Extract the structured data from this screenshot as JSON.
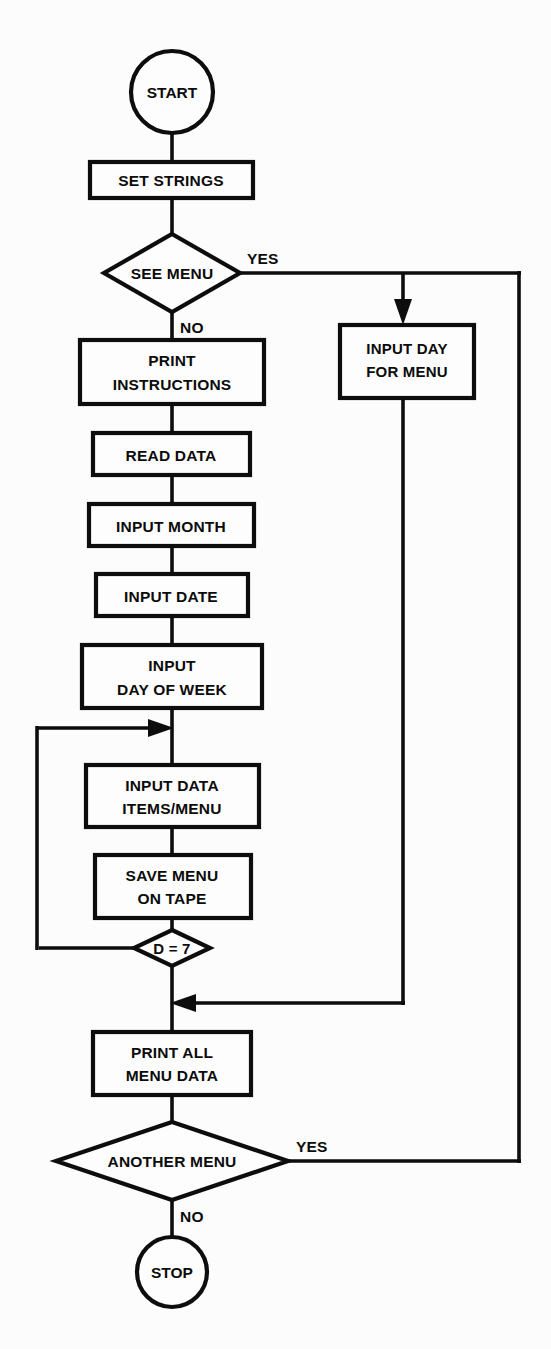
{
  "diagram": {
    "background_color": "#fcfcfc",
    "line_color": "#0d0d0d",
    "shape_fill": "#fdfdfd"
  },
  "nodes": {
    "start": {
      "label": "START",
      "type": "terminator"
    },
    "set_strings": {
      "label": "SET STRINGS",
      "type": "process"
    },
    "see_menu": {
      "label": "SEE MENU",
      "type": "decision"
    },
    "input_day_for_menu": {
      "line1": "INPUT DAY",
      "line2": "FOR MENU",
      "type": "process"
    },
    "print_instructions": {
      "line1": "PRINT",
      "line2": "INSTRUCTIONS",
      "type": "process"
    },
    "read_data": {
      "label": "READ DATA",
      "type": "process"
    },
    "input_month": {
      "label": "INPUT MONTH",
      "type": "process"
    },
    "input_date": {
      "label": "INPUT DATE",
      "type": "process"
    },
    "input_day_of_week": {
      "line1": "INPUT",
      "line2": "DAY OF WEEK",
      "type": "process"
    },
    "input_data_items": {
      "line1": "INPUT DATA",
      "line2": "ITEMS/MENU",
      "type": "process"
    },
    "save_menu_on_tape": {
      "line1": "SAVE MENU",
      "line2": "ON TAPE",
      "type": "process"
    },
    "d_equals_7": {
      "label": "D = 7",
      "type": "decision"
    },
    "print_all_menu_data": {
      "line1": "PRINT ALL",
      "line2": "MENU DATA",
      "type": "process"
    },
    "another_menu": {
      "label": "ANOTHER MENU",
      "type": "decision"
    },
    "stop": {
      "label": "STOP",
      "type": "terminator"
    }
  },
  "edge_labels": {
    "see_menu_yes": "YES",
    "see_menu_no": "NO",
    "another_menu_yes": "YES",
    "another_menu_no": "NO"
  },
  "flow": {
    "type": "flowchart",
    "edges": [
      {
        "from": "start",
        "to": "set_strings",
        "label": ""
      },
      {
        "from": "set_strings",
        "to": "see_menu",
        "label": ""
      },
      {
        "from": "see_menu",
        "to": "input_day_for_menu",
        "label": "YES"
      },
      {
        "from": "see_menu",
        "to": "print_instructions",
        "label": "NO"
      },
      {
        "from": "print_instructions",
        "to": "read_data",
        "label": ""
      },
      {
        "from": "read_data",
        "to": "input_month",
        "label": ""
      },
      {
        "from": "input_month",
        "to": "input_date",
        "label": ""
      },
      {
        "from": "input_date",
        "to": "input_day_of_week",
        "label": ""
      },
      {
        "from": "input_day_of_week",
        "to": "input_data_items",
        "label": ""
      },
      {
        "from": "input_data_items",
        "to": "save_menu_on_tape",
        "label": ""
      },
      {
        "from": "save_menu_on_tape",
        "to": "d_equals_7",
        "label": ""
      },
      {
        "from": "d_equals_7",
        "to": "input_data_items",
        "label": ""
      },
      {
        "from": "d_equals_7",
        "to": "print_all_menu_data",
        "label": ""
      },
      {
        "from": "input_day_for_menu",
        "to": "print_all_menu_data",
        "label": ""
      },
      {
        "from": "print_all_menu_data",
        "to": "another_menu",
        "label": ""
      },
      {
        "from": "another_menu",
        "to": "input_day_for_menu",
        "label": "YES"
      },
      {
        "from": "another_menu",
        "to": "stop",
        "label": "NO"
      }
    ]
  }
}
